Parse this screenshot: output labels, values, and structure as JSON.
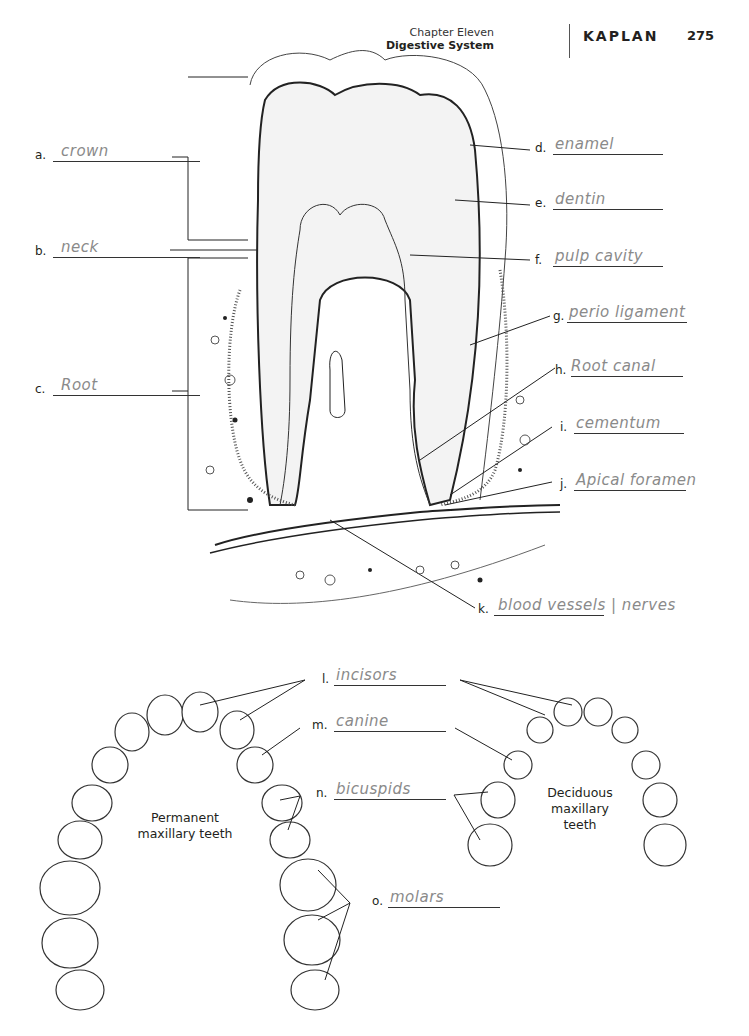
{
  "header": {
    "chapter": "Chapter Eleven",
    "section": "Digestive System",
    "brand": "KAPLAN",
    "page_number": "275"
  },
  "tooth_diagram": {
    "labels": [
      {
        "letter": "a.",
        "answer": "crown"
      },
      {
        "letter": "b.",
        "answer": "neck"
      },
      {
        "letter": "c.",
        "answer": "Root"
      },
      {
        "letter": "d.",
        "answer": "enamel"
      },
      {
        "letter": "e.",
        "answer": "dentin"
      },
      {
        "letter": "f.",
        "answer": "pulp cavity"
      },
      {
        "letter": "g.",
        "answer": "perio ligament"
      },
      {
        "letter": "h.",
        "answer": "Root canal"
      },
      {
        "letter": "i.",
        "answer": "cementum"
      },
      {
        "letter": "j.",
        "answer": "Apical foramen"
      },
      {
        "letter": "k.",
        "answer": "blood vessels | nerves"
      }
    ]
  },
  "teeth_diagram": {
    "labels": [
      {
        "letter": "l.",
        "answer": "incisors"
      },
      {
        "letter": "m.",
        "answer": "canine"
      },
      {
        "letter": "n.",
        "answer": "bicuspids"
      },
      {
        "letter": "o.",
        "answer": "molars"
      }
    ],
    "captions": {
      "permanent": "Permanent maxillary teeth",
      "deciduous": "Deciduous maxillary teeth"
    }
  }
}
